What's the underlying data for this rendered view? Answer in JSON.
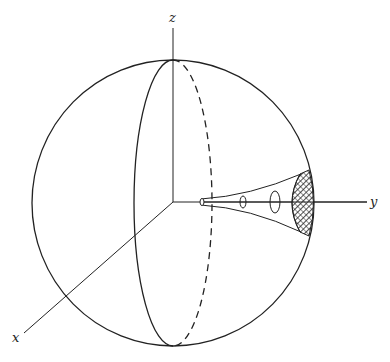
{
  "diagram": {
    "type": "3d-sphere-coordinate-figure",
    "axes": {
      "x_label": "x",
      "y_label": "y",
      "z_label": "z"
    },
    "elements": [
      "sphere outline",
      "vertical great-circle meridian (front solid, back dashed)",
      "cone along positive y-axis from origin toward sphere surface",
      "three cross-section ellipses on cone",
      "cross-hatched cap region on sphere surface at y-axis"
    ],
    "colors": {
      "line": "#222222",
      "background": "#ffffff"
    }
  }
}
